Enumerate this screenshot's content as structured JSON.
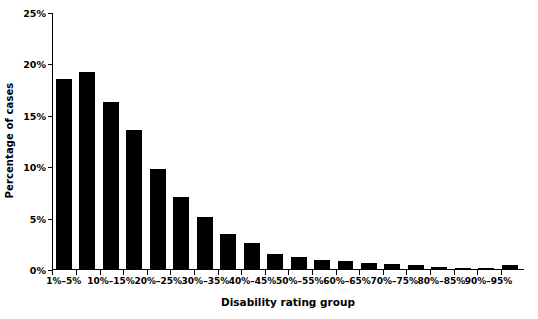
{
  "chart_data": {
    "type": "bar",
    "title": "",
    "xlabel": "Disability rating group",
    "ylabel": "Percentage of cases",
    "ylim": [
      0,
      25
    ],
    "ytick_labels": [
      "0%",
      "5%",
      "10%",
      "15%",
      "20%",
      "25%"
    ],
    "ytick_values": [
      0,
      5,
      10,
      15,
      20,
      25
    ],
    "grid": false,
    "legend": null,
    "categories": [
      "1%–5%",
      "6%–9%",
      "10%–15%",
      "16%–19%",
      "20%–25%",
      "26%–29%",
      "30%–35%",
      "36%–39%",
      "40%–45%",
      "46%–49%",
      "50%–55%",
      "56%–59%",
      "60%–65%",
      "66%–69%",
      "70%–75%",
      "76%–79%",
      "80%–85%",
      "86%–89%",
      "90%–95%",
      "96%–100%"
    ],
    "visible_xtick_labels": [
      "1%–5%",
      "10%–15%",
      "20%–25%",
      "30%–35%",
      "40%–45%",
      "50%–55%",
      "60%–65%",
      "70%–75%",
      "80%–85%",
      "90%–95%"
    ],
    "visible_xtick_indices": [
      0,
      2,
      4,
      6,
      8,
      10,
      12,
      14,
      16,
      18
    ],
    "values": [
      18.5,
      19.2,
      16.2,
      13.5,
      9.7,
      7.0,
      5.1,
      3.4,
      2.5,
      1.5,
      1.2,
      0.9,
      0.75,
      0.55,
      0.45,
      0.35,
      0.2,
      0.1,
      0.05,
      0.35
    ],
    "bar_color": "#000000",
    "axis_color": "#000000"
  }
}
